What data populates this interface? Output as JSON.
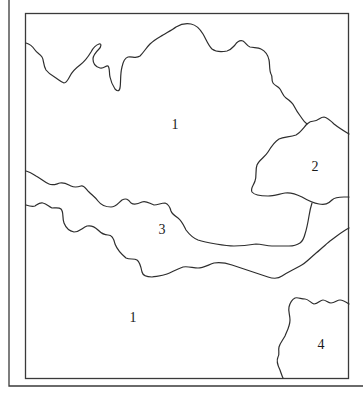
{
  "map": {
    "type": "schematic region map",
    "colors": {
      "background": "#ffffff",
      "lines": "#2e2e2e",
      "labels": "#1a1a1a"
    },
    "regions": [
      {
        "id": "region-1-north",
        "label": "1",
        "x": 175,
        "y": 126
      },
      {
        "id": "region-2",
        "label": "2",
        "x": 315,
        "y": 168
      },
      {
        "id": "region-3",
        "label": "3",
        "x": 162,
        "y": 231
      },
      {
        "id": "region-1-south",
        "label": "1",
        "x": 133,
        "y": 319
      },
      {
        "id": "region-4",
        "label": "4",
        "x": 321,
        "y": 346
      }
    ]
  }
}
